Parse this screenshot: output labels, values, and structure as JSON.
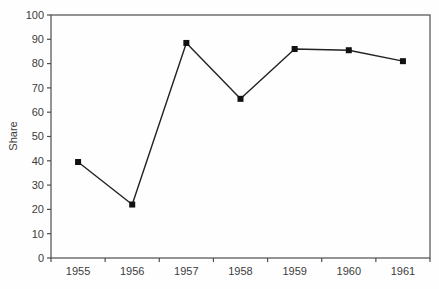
{
  "chart_data": {
    "type": "line",
    "categories": [
      "1955",
      "1956",
      "1957",
      "1958",
      "1959",
      "1960",
      "1961"
    ],
    "series": [
      {
        "name": "Share",
        "values": [
          39.5,
          22,
          88.5,
          65.5,
          86,
          85.5,
          81
        ]
      }
    ],
    "title": "",
    "xlabel": "",
    "ylabel": "Share",
    "ylim": [
      0,
      100
    ],
    "ytick_step": 10,
    "yticks": [
      0,
      10,
      20,
      30,
      40,
      50,
      60,
      70,
      80,
      90,
      100
    ],
    "grid": false,
    "legend": "none",
    "plot_frame": true,
    "marker": "filled-square",
    "colors": {
      "line": "#222222",
      "marker": "#111111",
      "axis": "#4d4d4d",
      "text": "#3c3c3c",
      "background": "#fefefe"
    }
  }
}
